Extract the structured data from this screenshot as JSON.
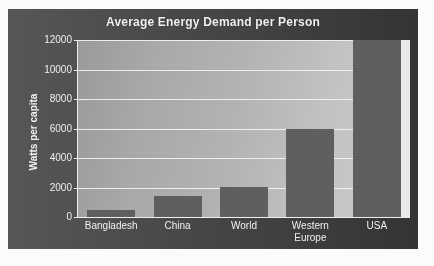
{
  "chart_data": {
    "type": "bar",
    "title": "Average Energy Demand per Person",
    "xlabel": "",
    "ylabel": "Watts per capita",
    "categories": [
      "Bangladesh",
      "China",
      "World",
      "Western Europe",
      "USA"
    ],
    "values": [
      475,
      1420,
      2030,
      6000,
      12000
    ],
    "value_notes": {
      "USA": "bar reaches / exceeds the top of the axis (clipped at 12000)"
    },
    "ylim": [
      0,
      12000
    ],
    "ytick_labels": [
      "0",
      "2000",
      "4000",
      "6000",
      "8000",
      "10000",
      "12000"
    ],
    "ytick_values": [
      0,
      2000,
      4000,
      6000,
      8000,
      10000,
      12000
    ],
    "grid": true,
    "legend": null,
    "series": [
      {
        "name": "Average energy demand per person",
        "values": [
          475,
          1420,
          2030,
          6000,
          12000
        ]
      }
    ]
  },
  "colors": {
    "panel_background": "#4c4c4c",
    "plot_background_left": "#9a9a9a",
    "plot_background_right": "#cdcdcd",
    "bar_fill": "#5f5f5f",
    "gridline": "#f4f4f4",
    "text": "#f1f1f1",
    "page_background": "#fbfbfa"
  },
  "x_label_lines": {
    "bangladesh": "Bangladesh",
    "china": "China",
    "world": "World",
    "western_europe_line1": "Western",
    "western_europe_line2": "Europe",
    "usa": "USA"
  }
}
